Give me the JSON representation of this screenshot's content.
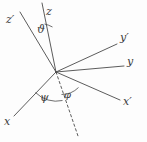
{
  "figure": {
    "name": "euler-angle-axes-diagram",
    "background_color": "#fdfdfd",
    "line_color": "#4a4a4a",
    "label_color": "#3a3a3a",
    "width": 147,
    "height": 142
  },
  "origin": {
    "x": 56,
    "y": 72
  },
  "axes": [
    {
      "id": "z-prime",
      "label": "z′",
      "icon": "axis-line-icon",
      "style": "solid",
      "from": {
        "x": 56,
        "y": 72
      },
      "to": {
        "x": 20,
        "y": 12
      },
      "label_pos": {
        "x": 6,
        "y": 14
      }
    },
    {
      "id": "z",
      "label": "z",
      "icon": "axis-line-icon",
      "style": "solid",
      "from": {
        "x": 56,
        "y": 72
      },
      "to": {
        "x": 42,
        "y": 3
      },
      "label_pos": {
        "x": 46,
        "y": 6
      }
    },
    {
      "id": "y-prime",
      "label": "y′",
      "icon": "axis-line-icon",
      "style": "solid",
      "from": {
        "x": 56,
        "y": 72
      },
      "to": {
        "x": 117,
        "y": 44
      },
      "label_pos": {
        "x": 120,
        "y": 32
      }
    },
    {
      "id": "y",
      "label": "y",
      "icon": "axis-line-icon",
      "style": "solid",
      "from": {
        "x": 56,
        "y": 72
      },
      "to": {
        "x": 124,
        "y": 66
      },
      "label_pos": {
        "x": 127,
        "y": 56
      }
    },
    {
      "id": "x-prime",
      "label": "x′",
      "icon": "axis-line-icon",
      "style": "solid",
      "from": {
        "x": 56,
        "y": 72
      },
      "to": {
        "x": 120,
        "y": 100
      },
      "label_pos": {
        "x": 123,
        "y": 96
      }
    },
    {
      "id": "x",
      "label": "x",
      "icon": "axis-line-icon",
      "style": "solid",
      "from": {
        "x": 56,
        "y": 72
      },
      "to": {
        "x": 14,
        "y": 116
      },
      "label_pos": {
        "x": 4,
        "y": 116
      }
    },
    {
      "id": "node-line",
      "label": "",
      "icon": "dashed-line-icon",
      "style": "dashed",
      "from": {
        "x": 56,
        "y": 72
      },
      "to": {
        "x": 78,
        "y": 136
      },
      "label_pos": null
    }
  ],
  "angles": [
    {
      "id": "theta",
      "label": "ϑ",
      "between": [
        "z-prime",
        "z"
      ],
      "arc": "M 44.5 24 A 30 30 0 0 1 52.5 27",
      "label_pos": {
        "x": 37,
        "y": 24
      }
    },
    {
      "id": "psi",
      "label": "ψ",
      "between": [
        "x",
        "node-line"
      ],
      "arc": "M 35.5 92.5 A 29 29 0 0 0 62.5 100.5",
      "label_pos": {
        "x": 40,
        "y": 92
      }
    },
    {
      "id": "phi",
      "label": "φ",
      "between": [
        "node-line",
        "x-prime"
      ],
      "arc": "M 61.5 94.5 A 24 24 0 0 0 78.5 87.5",
      "label_pos": {
        "x": 64,
        "y": 90
      }
    }
  ]
}
